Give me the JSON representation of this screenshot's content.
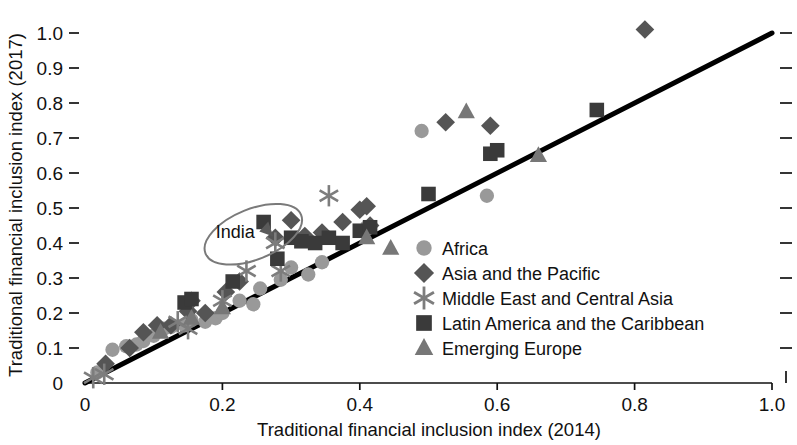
{
  "chart_data": {
    "type": "scatter",
    "title": "",
    "xlabel": "Traditional financial inclusion index (2014)",
    "ylabel": "Traditional financial inclusion index (2017)",
    "xlim": [
      0,
      1.0
    ],
    "ylim": [
      0,
      1.05
    ],
    "grid": false,
    "legend_position": "center-right",
    "xticks": [
      "0",
      "0.2",
      "0.4",
      "0.6",
      "0.8",
      "1.0"
    ],
    "xtick_values": [
      0,
      0.2,
      0.4,
      0.6,
      0.8,
      1.0
    ],
    "yticks": [
      "0",
      "0.1",
      "0.2",
      "0.3",
      "0.4",
      "0.5",
      "0.6",
      "0.7",
      "0.8",
      "0.9",
      "1.0"
    ],
    "ytick_values": [
      0,
      0.1,
      0.2,
      0.3,
      0.4,
      0.5,
      0.6,
      0.7,
      0.8,
      0.9,
      1.0
    ],
    "reference_line": {
      "from": [
        0,
        0
      ],
      "to": [
        1.0,
        1.0
      ],
      "label": "45-degree line"
    },
    "annotations": [
      {
        "text": "India",
        "x": 0.215,
        "y": 0.435,
        "arrow_to": [
          0.277,
          0.41
        ],
        "ellipse": {
          "cx": 0.245,
          "cy": 0.425,
          "rx": 0.075,
          "ry": 0.072,
          "rotation": -22
        }
      }
    ],
    "series": [
      {
        "name": "Africa",
        "marker": "circle",
        "color": "#999999",
        "points": [
          [
            0.018,
            0.03
          ],
          [
            0.04,
            0.095
          ],
          [
            0.06,
            0.105
          ],
          [
            0.075,
            0.11
          ],
          [
            0.085,
            0.12
          ],
          [
            0.1,
            0.135
          ],
          [
            0.115,
            0.155
          ],
          [
            0.125,
            0.16
          ],
          [
            0.145,
            0.165
          ],
          [
            0.155,
            0.18
          ],
          [
            0.175,
            0.175
          ],
          [
            0.19,
            0.185
          ],
          [
            0.2,
            0.2
          ],
          [
            0.225,
            0.235
          ],
          [
            0.245,
            0.225
          ],
          [
            0.255,
            0.27
          ],
          [
            0.285,
            0.295
          ],
          [
            0.3,
            0.33
          ],
          [
            0.325,
            0.31
          ],
          [
            0.345,
            0.345
          ],
          [
            0.41,
            0.445
          ],
          [
            0.49,
            0.72
          ],
          [
            0.585,
            0.535
          ]
        ]
      },
      {
        "name": "Asia and the Pacific",
        "marker": "diamond",
        "color": "#555555",
        "points": [
          [
            0.03,
            0.055
          ],
          [
            0.065,
            0.1
          ],
          [
            0.085,
            0.145
          ],
          [
            0.105,
            0.165
          ],
          [
            0.125,
            0.165
          ],
          [
            0.15,
            0.205
          ],
          [
            0.155,
            0.235
          ],
          [
            0.175,
            0.2
          ],
          [
            0.205,
            0.26
          ],
          [
            0.225,
            0.29
          ],
          [
            0.277,
            0.415
          ],
          [
            0.3,
            0.465
          ],
          [
            0.32,
            0.42
          ],
          [
            0.345,
            0.43
          ],
          [
            0.375,
            0.46
          ],
          [
            0.4,
            0.495
          ],
          [
            0.41,
            0.505
          ],
          [
            0.415,
            0.45
          ],
          [
            0.525,
            0.745
          ],
          [
            0.59,
            0.735
          ],
          [
            0.815,
            1.01
          ]
        ]
      },
      {
        "name": "Middle East and Central Asia",
        "marker": "asterisk",
        "color": "#7d7d7d",
        "points": [
          [
            0.012,
            0.015
          ],
          [
            0.028,
            0.025
          ],
          [
            0.135,
            0.175
          ],
          [
            0.15,
            0.155
          ],
          [
            0.2,
            0.235
          ],
          [
            0.235,
            0.32
          ],
          [
            0.277,
            0.4
          ],
          [
            0.285,
            0.32
          ],
          [
            0.355,
            0.535
          ]
        ]
      },
      {
        "name": "Latin America and the Caribbean",
        "marker": "square",
        "color": "#3a3a3a",
        "points": [
          [
            0.145,
            0.23
          ],
          [
            0.155,
            0.24
          ],
          [
            0.215,
            0.29
          ],
          [
            0.26,
            0.46
          ],
          [
            0.28,
            0.355
          ],
          [
            0.3,
            0.415
          ],
          [
            0.315,
            0.405
          ],
          [
            0.335,
            0.4
          ],
          [
            0.355,
            0.415
          ],
          [
            0.375,
            0.4
          ],
          [
            0.4,
            0.435
          ],
          [
            0.415,
            0.445
          ],
          [
            0.5,
            0.54
          ],
          [
            0.59,
            0.655
          ],
          [
            0.6,
            0.665
          ],
          [
            0.745,
            0.78
          ]
        ]
      },
      {
        "name": "Emerging Europe",
        "marker": "triangle",
        "color": "#777777",
        "points": [
          [
            0.11,
            0.145
          ],
          [
            0.155,
            0.185
          ],
          [
            0.2,
            0.215
          ],
          [
            0.41,
            0.415
          ],
          [
            0.445,
            0.385
          ],
          [
            0.555,
            0.775
          ],
          [
            0.66,
            0.65
          ]
        ]
      }
    ]
  },
  "axis": {
    "x_title": "Traditional financial inclusion index (2014)",
    "y_title": "Traditional financial inclusion index (2017)"
  },
  "legend": {
    "items": [
      {
        "label": "Africa",
        "marker": "circle-icon",
        "color": "#999999"
      },
      {
        "label": "Asia and the Pacific",
        "marker": "diamond-icon",
        "color": "#555555"
      },
      {
        "label": "Middle East and Central Asia",
        "marker": "asterisk-icon",
        "color": "#7d7d7d"
      },
      {
        "label": "Latin America and the Caribbean",
        "marker": "square-icon",
        "color": "#3a3a3a"
      },
      {
        "label": "Emerging Europe",
        "marker": "triangle-icon",
        "color": "#777777"
      }
    ]
  },
  "annotation": {
    "india_label": "India"
  }
}
